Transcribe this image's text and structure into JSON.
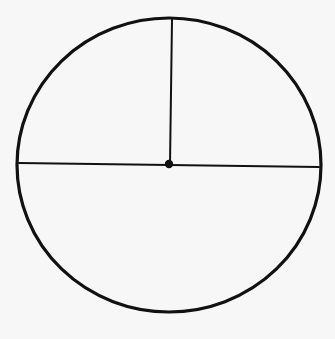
{
  "diagram": {
    "type": "geometry",
    "background_color": "#f7f7f7",
    "stroke_color": "#111111",
    "circle": {
      "cx": 169,
      "cy": 165,
      "rx": 152,
      "ry": 147,
      "stroke_width": 3.2
    },
    "center_point": {
      "cx": 169,
      "cy": 164,
      "r": 4.2
    },
    "diameter": {
      "x1": 19,
      "y1": 163,
      "x2": 319,
      "y2": 167,
      "stroke_width": 2
    },
    "radius": {
      "x1": 172,
      "y1": 20,
      "x2": 170,
      "y2": 164,
      "stroke_width": 2
    },
    "labels": []
  }
}
